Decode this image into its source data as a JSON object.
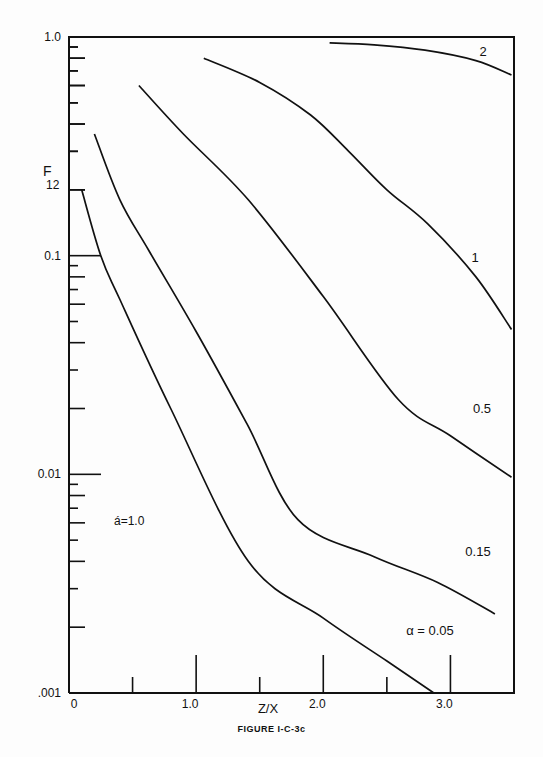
{
  "caption": "FIGURE I-C-3c",
  "chart_data": {
    "type": "line",
    "title": "",
    "xlabel": "Z/X",
    "ylabel": "F12",
    "xscale": "linear",
    "yscale": "log",
    "xlim": [
      0,
      3.5
    ],
    "ylim": [
      0.001,
      1.0
    ],
    "x_tick_labels": [
      "0",
      "1.0",
      "2.0",
      "3.0"
    ],
    "x_ticks": [
      0,
      0.5,
      1.0,
      1.5,
      2.0,
      2.5,
      3.0
    ],
    "y_tick_labels": [
      ".001",
      "0.01",
      "0.1",
      "1.0"
    ],
    "grid": false,
    "legend": "inline curve labels",
    "annotation": "á=1.0",
    "series": [
      {
        "name": "2",
        "label": "2",
        "x": [
          2.05,
          2.4,
          2.8,
          3.2,
          3.48
        ],
        "y": [
          0.94,
          0.92,
          0.87,
          0.78,
          0.67
        ]
      },
      {
        "name": "1",
        "label": "1",
        "x": [
          1.06,
          1.5,
          1.9,
          2.2,
          2.5,
          2.82,
          3.2,
          3.48
        ],
        "y": [
          0.8,
          0.62,
          0.44,
          0.3,
          0.2,
          0.14,
          0.08,
          0.046
        ]
      },
      {
        "name": "0.5",
        "label": "0.5",
        "x": [
          0.55,
          0.9,
          1.41,
          2.0,
          2.59,
          3.0,
          3.48
        ],
        "y": [
          0.6,
          0.36,
          0.18,
          0.065,
          0.022,
          0.015,
          0.0097
        ]
      },
      {
        "name": "0.15",
        "label": "0.15",
        "x": [
          0.2,
          0.4,
          0.63,
          1.0,
          1.4,
          1.8,
          2.4,
          2.9,
          3.35
        ],
        "y": [
          0.36,
          0.18,
          0.105,
          0.045,
          0.017,
          0.0062,
          0.0042,
          0.0032,
          0.0023
        ]
      },
      {
        "name": "0.05",
        "label": "α = 0.05",
        "x": [
          0.1,
          0.25,
          0.4,
          0.8,
          1.41,
          2.0,
          2.5,
          2.87
        ],
        "y": [
          0.2,
          0.1,
          0.063,
          0.02,
          0.004,
          0.0022,
          0.0014,
          0.001
        ]
      }
    ]
  }
}
